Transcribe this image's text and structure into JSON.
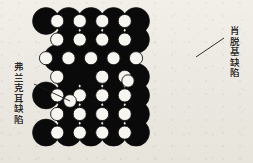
{
  "figure": {
    "title": "",
    "background_color": "#efece6",
    "ion_large_color": "#0a0a0a",
    "ion_small_color": "#f7f5f0",
    "outline_color": "#111111",
    "pointer_color": "#1a1a1a"
  },
  "annotations": {
    "frenkel": {
      "label": "弗兰克耳缺陷",
      "meaning": "Frenkel defect",
      "pointer_from": [
        34,
        84
      ],
      "pointer_to": [
        70,
        101
      ]
    },
    "schottky": {
      "label": "肖脱基缺陷",
      "meaning": "Schottky defect",
      "pointer_from": [
        224,
        38
      ],
      "pointer_to": [
        196,
        57
      ]
    }
  },
  "lattice": {
    "kind": "ionic-crystal-point-defects",
    "large_radius": 13.5,
    "small_radius": 6.6,
    "col_pitch": 22.5,
    "row_pitch": 18.6,
    "origin": [
      46,
      21
    ],
    "cols": 8,
    "rows": 7,
    "rows_data": [
      {
        "row": 0,
        "offset": 0,
        "pattern": [
          "L",
          "S",
          "L",
          "S",
          "L",
          "S",
          "L",
          "S",
          "L"
        ]
      },
      {
        "row": 1,
        "offset": 11.2,
        "pattern": [
          "S",
          "L",
          "S",
          "L",
          "S",
          "L",
          "S",
          "L"
        ]
      },
      {
        "row": 2,
        "offset": 0,
        "pattern": [
          "S",
          "L",
          "S",
          "L",
          "S",
          "L",
          "S",
          "L",
          "S"
        ]
      },
      {
        "row": 3,
        "offset": 11.2,
        "pattern": [
          "S",
          "L",
          "V",
          "L",
          "S",
          "L",
          "S",
          "L"
        ]
      },
      {
        "row": 4,
        "offset": 0,
        "pattern": [
          "L",
          "S",
          "L",
          "S",
          "L",
          "S",
          "L",
          "S",
          "L"
        ]
      },
      {
        "row": 5,
        "offset": 11.2,
        "pattern": [
          "S",
          "L",
          "S",
          "L",
          "S",
          "L",
          "S",
          "L"
        ]
      },
      {
        "row": 6,
        "offset": 0,
        "pattern": [
          "L",
          "S",
          "L",
          "S",
          "L",
          "S",
          "L",
          "S",
          "L"
        ]
      }
    ],
    "legend": {
      "L": "large-black-ion",
      "S": "small-white-ion",
      "V": "vacancy"
    },
    "interstitials": [
      {
        "name": "frenkel-interstitial",
        "x": 70,
        "y": 101,
        "r": 6.4
      },
      {
        "name": "displaced-ion",
        "x": 128,
        "y": 81,
        "r": 6.2
      }
    ]
  }
}
